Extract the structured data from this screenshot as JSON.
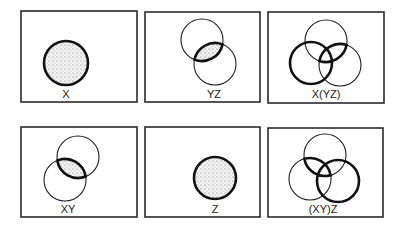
{
  "figure": {
    "colors": {
      "stroke": "#1e1e1e",
      "frame": "#2a2a2a",
      "shade_dots": "#6a6a6a",
      "background": "#ffffff"
    },
    "panels": [
      {
        "id": "x",
        "label": "X",
        "row": 1,
        "col": 1,
        "frame": {
          "x": 21,
          "y": 11,
          "w": 116,
          "h": 91
        },
        "circles": [
          {
            "set": "X",
            "cx": 66,
            "cy": 63,
            "r": 22,
            "style": "bold",
            "shaded": true
          }
        ],
        "label_pos": {
          "x": 66,
          "y": 98
        }
      },
      {
        "id": "yz",
        "label": "YZ",
        "row": 1,
        "col": 2,
        "frame": {
          "x": 145,
          "y": 12,
          "w": 115,
          "h": 90
        },
        "circles": [
          {
            "set": "Y",
            "cx": 202,
            "cy": 40,
            "r": 21,
            "style": "thin",
            "shaded": false
          },
          {
            "set": "Z",
            "cx": 215,
            "cy": 64,
            "r": 21,
            "style": "thin",
            "shaded": false
          }
        ],
        "highlight": {
          "type": "lens",
          "sets": [
            "Y",
            "Z"
          ],
          "shaded": true,
          "bold_outline": true
        },
        "label_pos": {
          "x": 214,
          "y": 98
        }
      },
      {
        "id": "x-yz",
        "label": "X(YZ)",
        "row": 1,
        "col": 3,
        "frame": {
          "x": 268,
          "y": 12,
          "w": 116,
          "h": 91
        },
        "circles": [
          {
            "set": "Y",
            "cx": 326,
            "cy": 41,
            "r": 21,
            "style": "thin",
            "shaded": false
          },
          {
            "set": "X",
            "cx": 311,
            "cy": 63,
            "r": 21,
            "style": "bold",
            "shaded": false
          },
          {
            "set": "Z",
            "cx": 340,
            "cy": 65,
            "r": 21,
            "style": "thin",
            "shaded": false
          }
        ],
        "highlight": {
          "type": "lens",
          "sets": [
            "Y",
            "Z"
          ],
          "shaded": false,
          "bold_outline": true
        },
        "label_pos": {
          "x": 326,
          "y": 98
        }
      },
      {
        "id": "xy",
        "label": "XY",
        "row": 2,
        "col": 1,
        "frame": {
          "x": 21,
          "y": 127,
          "w": 116,
          "h": 90
        },
        "circles": [
          {
            "set": "Y",
            "cx": 78,
            "cy": 157,
            "r": 21,
            "style": "thin",
            "shaded": false
          },
          {
            "set": "X",
            "cx": 65,
            "cy": 180,
            "r": 21,
            "style": "thin",
            "shaded": false
          }
        ],
        "highlight": {
          "type": "lens",
          "sets": [
            "X",
            "Y"
          ],
          "shaded": true,
          "bold_outline": true
        },
        "label_pos": {
          "x": 68,
          "y": 213
        }
      },
      {
        "id": "z",
        "label": "Z",
        "row": 2,
        "col": 2,
        "frame": {
          "x": 145,
          "y": 127,
          "w": 115,
          "h": 90
        },
        "circles": [
          {
            "set": "Z",
            "cx": 215,
            "cy": 178,
            "r": 21,
            "style": "bold",
            "shaded": true
          }
        ],
        "label_pos": {
          "x": 215,
          "y": 213
        }
      },
      {
        "id": "xy-z",
        "label": "(XY)Z",
        "row": 2,
        "col": 3,
        "frame": {
          "x": 268,
          "y": 128,
          "w": 115,
          "h": 89
        },
        "circles": [
          {
            "set": "Y",
            "cx": 325,
            "cy": 155,
            "r": 21,
            "style": "thin",
            "shaded": false
          },
          {
            "set": "X",
            "cx": 310,
            "cy": 179,
            "r": 21,
            "style": "thin",
            "shaded": false
          },
          {
            "set": "Z",
            "cx": 338,
            "cy": 181,
            "r": 21,
            "style": "bold",
            "shaded": false
          }
        ],
        "highlight": {
          "type": "lens",
          "sets": [
            "X",
            "Y"
          ],
          "shaded": false,
          "bold_outline": true
        },
        "label_pos": {
          "x": 323,
          "y": 213
        }
      }
    ]
  }
}
